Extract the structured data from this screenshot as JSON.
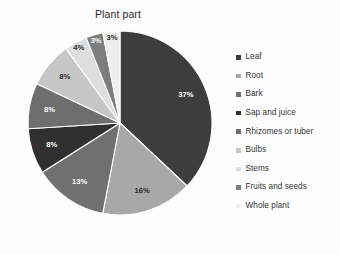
{
  "chart_data": {
    "type": "pie",
    "title": "Plant part",
    "xlabel": "",
    "ylabel": "",
    "legend_position": "right",
    "grid": false,
    "start_angle": 0,
    "direction": "clockwise",
    "categories": [
      "Leaf",
      "Root",
      "Bark",
      "Sap and juice",
      "Rhizomes or tuber",
      "Bulbs",
      "Stems",
      "Fruits and seeds",
      "Whole plant"
    ],
    "values": [
      37,
      16,
      13,
      8,
      8,
      8,
      4,
      3,
      3
    ],
    "value_labels": [
      "37%",
      "16%",
      "13%",
      "8%",
      "8%",
      "8%",
      "4%",
      "3%",
      "3%"
    ],
    "colors": [
      "#3d3d3d",
      "#a8a8a8",
      "#707070",
      "#303030",
      "#6e6e6e",
      "#c6c6c6",
      "#dedede",
      "#7d7d7d",
      "#eeeeee",
      "#9a9a9a"
    ],
    "slice_label_color_dark": [
      false,
      true,
      false,
      false,
      false,
      true,
      true,
      false,
      true
    ],
    "units": "percent",
    "total": 100
  },
  "legend": {
    "items": [
      {
        "label": "Leaf",
        "color": "#3d3d3d",
        "value": 37
      },
      {
        "label": "Root",
        "color": "#a8a8a8",
        "value": 16
      },
      {
        "label": "Bark",
        "color": "#707070",
        "value": 13
      },
      {
        "label": "Sap and juice",
        "color": "#303030",
        "value": 8
      },
      {
        "label": "Rhizomes or tuber",
        "color": "#6e6e6e",
        "value": 8
      },
      {
        "label": "Bulbs",
        "color": "#c6c6c6",
        "value": 8
      },
      {
        "label": "Stems",
        "color": "#dedede",
        "value": 4
      },
      {
        "label": "Fruits and seeds",
        "color": "#7d7d7d",
        "value": 3
      },
      {
        "label": "Whole plant",
        "color": "#eeeeee",
        "value": 3
      }
    ]
  },
  "geometry": {
    "center_x": 96,
    "center_y": 96,
    "radius": 92,
    "label_radius_factor": 0.78
  }
}
